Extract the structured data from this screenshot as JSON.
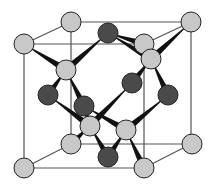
{
  "diagram": {
    "type": "crystal-unit-cell",
    "colors": {
      "light_atom": "#c8c8c8",
      "dark_atom": "#4a4a4a",
      "atom_stroke": "#222222",
      "cube_edge": "#555555",
      "bond": "#111111"
    },
    "cube": {
      "front": [
        [
          24,
          44
        ],
        [
          144,
          44
        ],
        [
          144,
          168
        ],
        [
          24,
          168
        ]
      ],
      "back": [
        [
          71,
          22
        ],
        [
          191,
          22
        ],
        [
          191,
          144
        ],
        [
          71,
          144
        ]
      ]
    },
    "light_atoms": [
      [
        71,
        22
      ],
      [
        191,
        22
      ],
      [
        24,
        44
      ],
      [
        144,
        44
      ],
      [
        151,
        59
      ],
      [
        66,
        70
      ],
      [
        90,
        126
      ],
      [
        126,
        130
      ],
      [
        71,
        144
      ],
      [
        192,
        144
      ],
      [
        24,
        168
      ],
      [
        144,
        168
      ]
    ],
    "dark_atoms": [
      [
        108,
        33
      ],
      [
        132,
        83
      ],
      [
        48,
        95
      ],
      [
        168,
        95
      ],
      [
        84,
        106
      ],
      [
        108,
        157
      ]
    ],
    "bonds": [
      [
        [
          24,
          44
        ],
        [
          66,
          70
        ]
      ],
      [
        [
          108,
          33
        ],
        [
          66,
          70
        ]
      ],
      [
        [
          66,
          70
        ],
        [
          48,
          95
        ]
      ],
      [
        [
          66,
          70
        ],
        [
          84,
          106
        ]
      ],
      [
        [
          108,
          33
        ],
        [
          144,
          44
        ]
      ],
      [
        [
          108,
          33
        ],
        [
          151,
          59
        ]
      ],
      [
        [
          191,
          22
        ],
        [
          151,
          59
        ]
      ],
      [
        [
          151,
          59
        ],
        [
          132,
          83
        ]
      ],
      [
        [
          151,
          59
        ],
        [
          168,
          95
        ]
      ],
      [
        [
          84,
          106
        ],
        [
          90,
          126
        ]
      ],
      [
        [
          84,
          106
        ],
        [
          126,
          130
        ]
      ],
      [
        [
          132,
          83
        ],
        [
          90,
          126
        ]
      ],
      [
        [
          48,
          95
        ],
        [
          90,
          126
        ]
      ],
      [
        [
          168,
          95
        ],
        [
          126,
          130
        ]
      ],
      [
        [
          90,
          126
        ],
        [
          71,
          144
        ]
      ],
      [
        [
          90,
          126
        ],
        [
          108,
          157
        ]
      ],
      [
        [
          126,
          130
        ],
        [
          108,
          157
        ]
      ],
      [
        [
          126,
          130
        ],
        [
          144,
          168
        ]
      ]
    ]
  }
}
